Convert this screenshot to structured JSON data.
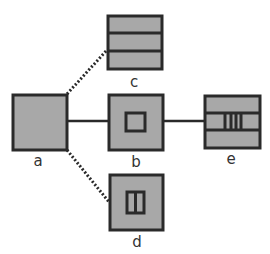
{
  "diagram": {
    "colors": {
      "fill": "#a8a8a8",
      "stroke": "#2a2a2a",
      "label": "#333333"
    },
    "nodes": [
      {
        "id": "a",
        "label": "a",
        "pattern": "plain"
      },
      {
        "id": "b",
        "label": "b",
        "pattern": "inner-square"
      },
      {
        "id": "c",
        "label": "c",
        "pattern": "three-rows"
      },
      {
        "id": "d",
        "label": "d",
        "pattern": "inner-split-rect"
      },
      {
        "id": "e",
        "label": "e",
        "pattern": "three-rows-with-bars"
      }
    ],
    "edges": [
      {
        "from": "a",
        "to": "b",
        "style": "solid"
      },
      {
        "from": "b",
        "to": "e",
        "style": "solid"
      },
      {
        "from": "a",
        "to": "c",
        "style": "dotted"
      },
      {
        "from": "a",
        "to": "d",
        "style": "dotted"
      }
    ]
  }
}
